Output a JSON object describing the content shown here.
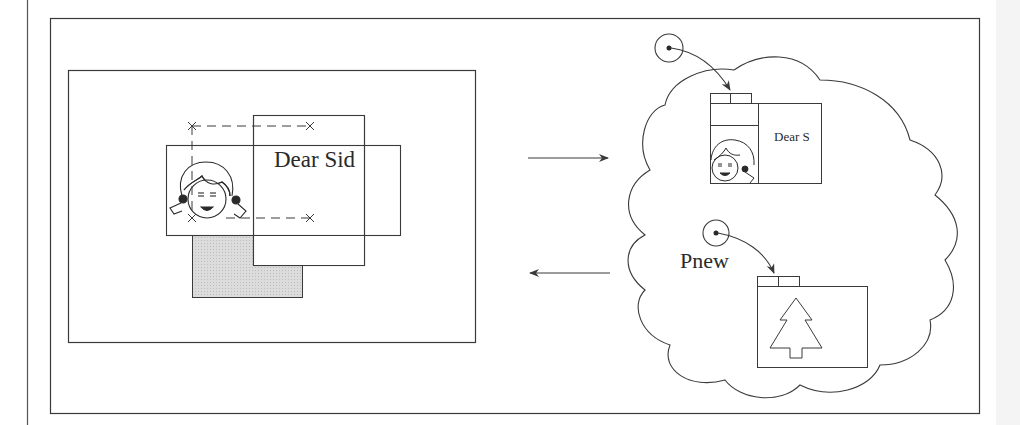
{
  "figure": {
    "colors": {
      "stroke": "#3a3a3a",
      "shaded": "#d9d9d9",
      "background": "#ffffff"
    }
  },
  "screen": {
    "document_window": {
      "text": "Dear Sid"
    },
    "image_window": {
      "icon": "girl-face-icon"
    },
    "shaded_window": {
      "fill": "#d9d9d9"
    }
  },
  "arrows": {
    "save": {
      "direction": "right"
    },
    "restore": {
      "direction": "left"
    }
  },
  "store": {
    "shape": "cloud",
    "saved_window": {
      "text": "Dear S",
      "icon": "girl-face-icon"
    },
    "new_window": {
      "label": "Pnew",
      "icon": "tree-icon"
    }
  }
}
